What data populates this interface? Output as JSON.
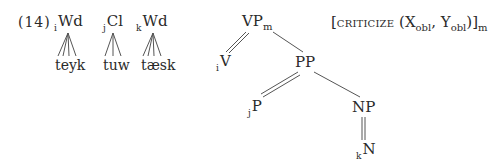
{
  "example_number": "(14)",
  "lexical_items": [
    {
      "index": "i",
      "category": "Wd",
      "form": "teyk"
    },
    {
      "index": "j",
      "category": "Cl",
      "form": "tuw"
    },
    {
      "index": "k",
      "category": "Wd",
      "form": "tæsk"
    }
  ],
  "tree": {
    "root": {
      "label": "VP",
      "subscript": "m"
    },
    "v_node": {
      "index": "i",
      "label": "V"
    },
    "pp_node": {
      "label": "PP"
    },
    "p_node": {
      "index": "j",
      "label": "P"
    },
    "np_node": {
      "label": "NP"
    },
    "n_node": {
      "index": "k",
      "label": "N"
    }
  },
  "semantics": {
    "open": "[",
    "predicate": "criticize",
    "arg_open": " (X",
    "x_sub": "obl",
    "comma": ", Y",
    "y_sub": "obl",
    "close": ")]",
    "outer_sub": "m"
  },
  "colors": {
    "ink": "#2a2a2a",
    "line": "#555555"
  }
}
